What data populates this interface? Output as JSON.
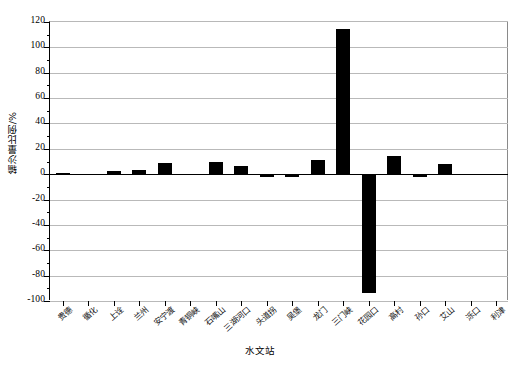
{
  "chart_data": {
    "type": "bar",
    "title": "",
    "xlabel": "水文站",
    "ylabel": "输沙量比例/%",
    "ylim": [
      -100,
      120
    ],
    "ytick_step": 20,
    "yticks": [
      120,
      100,
      80,
      60,
      40,
      20,
      0,
      -20,
      -40,
      -60,
      -80,
      -100
    ],
    "ytick_labels": [
      "120",
      "100",
      "80",
      "60",
      "40",
      "20",
      "0",
      "-20",
      "-40",
      "-60",
      "-80",
      "-100"
    ],
    "grid": true,
    "legend": "none",
    "bar_color": "#000000",
    "categories": [
      "贵德",
      "循化",
      "上诠",
      "兰州",
      "安宁渡",
      "青铜峡",
      "石嘴山",
      "三湖河口",
      "头道拐",
      "吴堡",
      "龙门",
      "三门峡",
      "花园口",
      "高村",
      "孙口",
      "艾山",
      "泺口",
      "利津"
    ],
    "values": [
      0.6,
      0.2,
      2.2,
      3.2,
      9.0,
      -1.0,
      9.5,
      6.5,
      -2.4,
      -2.2,
      11.5,
      114.5,
      -94.0,
      14.5,
      -2.6,
      8.2,
      -1.0,
      0.4
    ],
    "series": [
      {
        "name": "输沙量比例",
        "values": [
          0.6,
          0.2,
          2.2,
          3.2,
          9.0,
          -1.0,
          9.5,
          6.5,
          -2.4,
          -2.2,
          11.5,
          114.5,
          -94.0,
          14.5,
          -2.6,
          8.2,
          -1.0,
          0.4
        ]
      }
    ]
  }
}
